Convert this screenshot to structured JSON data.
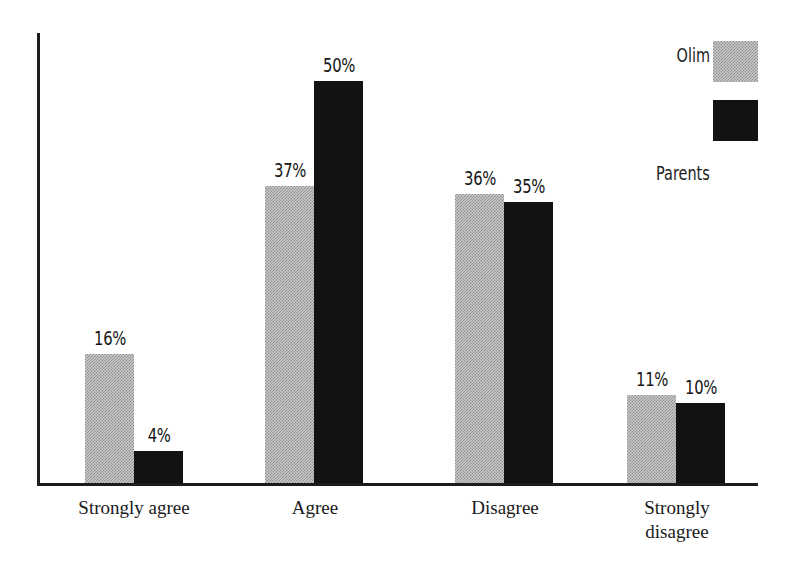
{
  "chart_data": {
    "type": "bar",
    "title": "",
    "subtitle": "",
    "xlabel": "",
    "ylabel": "",
    "ylim": [
      0,
      56
    ],
    "grid": false,
    "legend_position": "top-right",
    "categories": [
      "Strongly agree",
      "Agree",
      "Disagree",
      "Strongly disagree"
    ],
    "series": [
      {
        "name": "Olim",
        "color": "#a8a8a8",
        "fill": "gray-checkerboard",
        "values": [
          16,
          37,
          36,
          11
        ],
        "labels": [
          "16%",
          "37%",
          "36%",
          "11%"
        ]
      },
      {
        "name": "Parents",
        "color": "#121212",
        "fill": "solid-black",
        "values": [
          4,
          50,
          35,
          10
        ],
        "labels": [
          "4%",
          "50%",
          "35%",
          "10%"
        ]
      }
    ],
    "annotations": []
  },
  "legend": {
    "items": [
      {
        "label": "Olim",
        "swatch": "gray-checkerboard-swatch"
      },
      {
        "label": "Parents",
        "swatch": "black-swatch"
      }
    ]
  },
  "axes": {
    "y_axis_name": "y-axis-line",
    "x_axis_name": "x-axis-line",
    "tick_labels": []
  },
  "category_labels": [
    "Strongly agree",
    "Agree",
    "Disagree",
    "Strongly disagree"
  ]
}
